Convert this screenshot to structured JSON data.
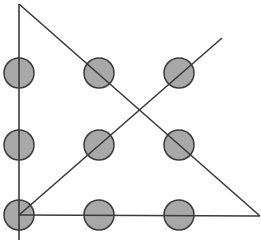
{
  "diagram": {
    "title": "",
    "width": 261,
    "height": 250,
    "colors": {
      "background": "#ffffff",
      "dot_fill": "#a8a8a8",
      "dot_stroke": "#3a3a3a",
      "line": "#3a3a3a"
    },
    "dot_radius": 15,
    "dots": [
      {
        "row": 0,
        "col": 0,
        "cx": 19,
        "cy": 73
      },
      {
        "row": 0,
        "col": 1,
        "cx": 99,
        "cy": 73
      },
      {
        "row": 0,
        "col": 2,
        "cx": 179,
        "cy": 73
      },
      {
        "row": 1,
        "col": 0,
        "cx": 19,
        "cy": 145
      },
      {
        "row": 1,
        "col": 1,
        "cx": 99,
        "cy": 145
      },
      {
        "row": 1,
        "col": 2,
        "cx": 179,
        "cy": 145
      },
      {
        "row": 2,
        "col": 0,
        "cx": 19,
        "cy": 215
      },
      {
        "row": 2,
        "col": 1,
        "cx": 99,
        "cy": 215
      },
      {
        "row": 2,
        "col": 2,
        "cx": 179,
        "cy": 215
      }
    ],
    "lines": [
      {
        "id": "vertical-left",
        "x1": 19,
        "y1": 4,
        "x2": 19,
        "y2": 240
      },
      {
        "id": "diagonal-down",
        "x1": 19,
        "y1": 4,
        "x2": 260,
        "y2": 216
      },
      {
        "id": "bottom-horizontal",
        "x1": 19,
        "y1": 215,
        "x2": 260,
        "y2": 216
      },
      {
        "id": "diagonal-up",
        "x1": 19,
        "y1": 215,
        "x2": 222,
        "y2": 38
      }
    ]
  }
}
